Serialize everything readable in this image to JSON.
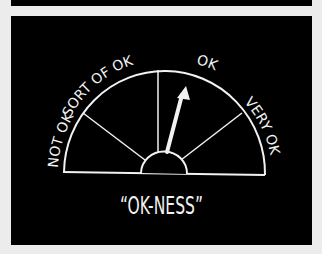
{
  "gauge": {
    "labels": [
      {
        "id": "not-ok",
        "text": "NOT OK"
      },
      {
        "id": "sort-of-ok",
        "text": "SORT OF OK"
      },
      {
        "id": "ok",
        "text": "OK"
      },
      {
        "id": "very-ok",
        "text": "VERY OK"
      }
    ],
    "needle_points_to": "OK",
    "caption": "“OK-NESS”"
  },
  "colors": {
    "background": "#000000",
    "stroke": "#f2f2f2",
    "page": "#ececec"
  }
}
